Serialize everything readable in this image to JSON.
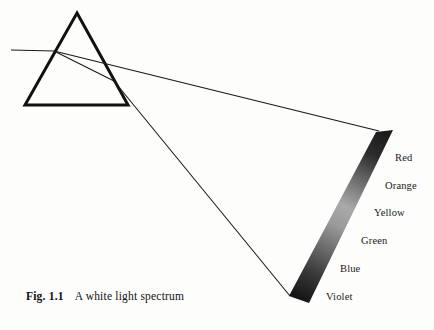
{
  "figure": {
    "caption_id": "Fig. 1.1",
    "caption_text": "A white light spectrum",
    "background_color": "#fdfdfb",
    "ink_color": "#111111"
  },
  "prism": {
    "name": "triangular glass prism",
    "apex": {
      "x": 77,
      "y": 13
    },
    "bottom_left": {
      "x": 25,
      "y": 105
    },
    "bottom_right": {
      "x": 128,
      "y": 105
    },
    "stroke_color": "#111111",
    "stroke_width": 3
  },
  "rays": {
    "incident": {
      "label": "incoming white light ray",
      "start": {
        "x": 11,
        "y": 50
      },
      "end": {
        "x": 54,
        "y": 51
      }
    },
    "internal": {
      "label": "refracted ray inside prism",
      "start": {
        "x": 54,
        "y": 51
      },
      "end": {
        "x": 114,
        "y": 81
      }
    },
    "upper_emergent": {
      "label": "red edge emergent ray",
      "start": {
        "x": 54,
        "y": 51
      },
      "end": {
        "x": 379,
        "y": 131
      }
    },
    "lower_emergent": {
      "label": "violet edge emergent ray",
      "start": {
        "x": 114,
        "y": 81
      },
      "end": {
        "x": 290,
        "y": 296
      }
    },
    "stroke_color": "#1a1a1a",
    "stroke_width": 1
  },
  "spectrum_band": {
    "label": "dispersed spectrum band on screen",
    "corners": {
      "top_left": {
        "x": 376,
        "y": 132
      },
      "top_right": {
        "x": 393,
        "y": 130
      },
      "bottom_right": {
        "x": 309,
        "y": 303
      },
      "bottom_left": {
        "x": 289,
        "y": 296
      }
    },
    "gradient_stops": [
      {
        "offset": "0%",
        "color": "#1b1b1b"
      },
      {
        "offset": "14%",
        "color": "#2c2c2c"
      },
      {
        "offset": "30%",
        "color": "#6e6e6e"
      },
      {
        "offset": "45%",
        "color": "#a9a9a9"
      },
      {
        "offset": "56%",
        "color": "#9a9a9a"
      },
      {
        "offset": "70%",
        "color": "#6a6a6a"
      },
      {
        "offset": "84%",
        "color": "#3a3a3a"
      },
      {
        "offset": "100%",
        "color": "#141414"
      }
    ]
  },
  "color_labels": [
    {
      "name": "Red",
      "x": 395,
      "y": 152
    },
    {
      "name": "Orange",
      "x": 385,
      "y": 180
    },
    {
      "name": "Yellow",
      "x": 374,
      "y": 207
    },
    {
      "name": "Green",
      "x": 361,
      "y": 235
    },
    {
      "name": "Blue",
      "x": 340,
      "y": 263
    },
    {
      "name": "Violet",
      "x": 326,
      "y": 291
    }
  ]
}
